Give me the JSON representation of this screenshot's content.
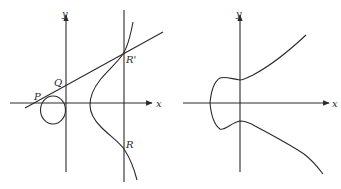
{
  "figure": {
    "colors": {
      "background": "#ffffff",
      "stroke": "#2a2a2a"
    },
    "panels": [
      {
        "id": "left",
        "axis_labels": {
          "x": "x",
          "y": "y"
        },
        "points": [
          {
            "label": "P",
            "description": "intersection of secant line with oval component"
          },
          {
            "label": "Q",
            "description": "second intersection of secant line with oval component"
          },
          {
            "label": "R'",
            "description": "third intersection of line with curve"
          },
          {
            "label": "R",
            "description": "reflection of R' across x-axis (P + Q)"
          }
        ],
        "elements": [
          "oval component",
          "unbounded component",
          "secant line through P and Q",
          "vertical line through R' and R"
        ]
      },
      {
        "id": "right",
        "axis_labels": {
          "x": "x",
          "y": "y"
        },
        "elements": [
          "single-component curve"
        ]
      }
    ]
  }
}
